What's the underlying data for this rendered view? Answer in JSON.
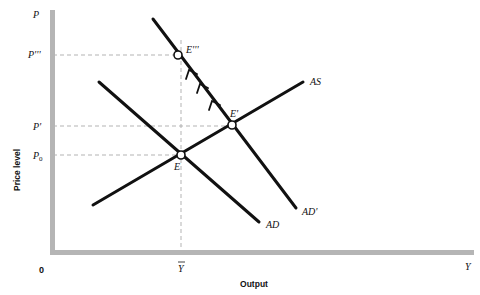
{
  "axes": {
    "y_axis_symbol": "P",
    "x_axis_symbol": "Y",
    "origin_label": "0",
    "y_axis_title": "Price level",
    "x_axis_title": "Output",
    "axis_color": "#b5b5b5"
  },
  "price_levels": [
    {
      "id": "P'''",
      "label": "P'''"
    },
    {
      "id": "P'",
      "label": "P'"
    },
    {
      "id": "P0",
      "label": "P",
      "subscript": "0"
    }
  ],
  "output_levels": [
    {
      "id": "Ybar",
      "label": "Y",
      "overbar": true
    }
  ],
  "curves": [
    {
      "id": "AS",
      "label": "AS"
    },
    {
      "id": "AD",
      "label": "AD"
    },
    {
      "id": "AD'",
      "label": "AD'"
    }
  ],
  "points": [
    {
      "id": "E",
      "label": "E"
    },
    {
      "id": "E'",
      "label": "E'"
    },
    {
      "id": "E'''",
      "label": "E'''"
    }
  ],
  "adjustment_path": {
    "from": "E'",
    "to": "E'''",
    "along": "AD'",
    "arrow_count": 3
  },
  "colors": {
    "curve": "#111111",
    "guide_dash": "#aaaaaa",
    "axis": "#b5b5b5"
  }
}
